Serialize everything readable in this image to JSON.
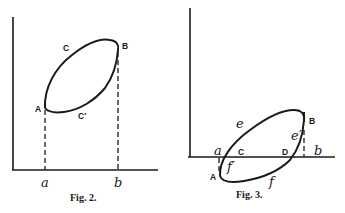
{
  "figures": [
    {
      "caption": "Fig. 2.",
      "points": {
        "A": "A",
        "B": "B",
        "C": "C",
        "C_prime": "C′"
      },
      "axis_marks": {
        "a": "a",
        "b": "b"
      }
    },
    {
      "caption": "Fig. 3.",
      "points": {
        "A": "A",
        "B": "B",
        "C": "C",
        "D": "D"
      },
      "axis_marks": {
        "a": "a",
        "b": "b"
      },
      "arc_labels": {
        "e": "e",
        "e_prime": "e′",
        "f": "f",
        "f_prime": "f′"
      }
    }
  ]
}
